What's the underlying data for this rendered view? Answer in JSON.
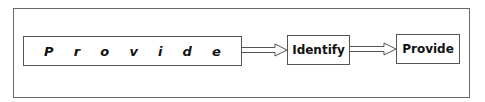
{
  "diagram": {
    "type": "flowchart",
    "spaced_box": {
      "letters": [
        "P",
        "r",
        "o",
        "v",
        "i",
        "d",
        "e"
      ]
    },
    "nodes": [
      {
        "id": "identify",
        "label": "Identify"
      },
      {
        "id": "provide",
        "label": "Provide"
      }
    ],
    "edges": [
      {
        "from": "spaced_box",
        "to": "identify"
      },
      {
        "from": "identify",
        "to": "provide"
      }
    ]
  }
}
